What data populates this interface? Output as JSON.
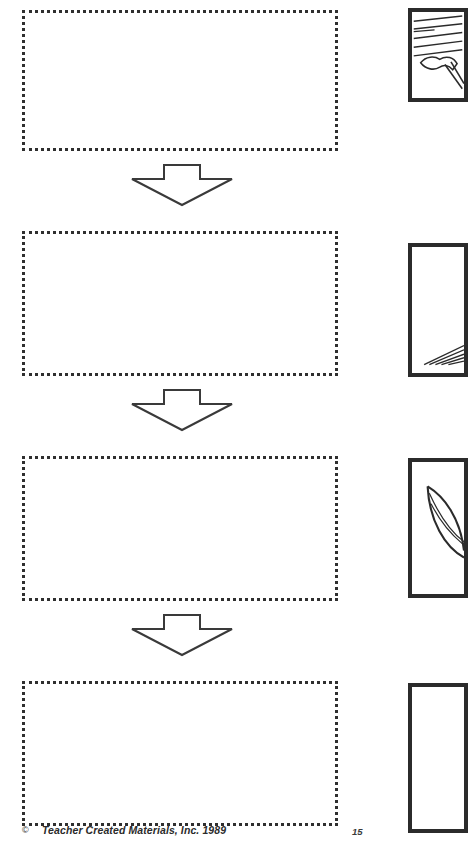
{
  "page": {
    "kind": "worksheet-page",
    "background_color": "#ffffff",
    "ink_color": "#2b2b2b",
    "page_number": "15",
    "footer": {
      "copyright_symbol": "©",
      "copyright_text": "Teacher Created Materials, Inc. 1989"
    }
  },
  "sequence": {
    "description": "Four blank dotted response boxes arranged vertically, joined by three downward block arrows.",
    "boxes": [
      {
        "id": "response-box-1",
        "label": "",
        "placeholder": "",
        "border_style": "dotted",
        "border_color": "#2f2f2f"
      },
      {
        "id": "response-box-2",
        "label": "",
        "placeholder": "",
        "border_style": "dotted",
        "border_color": "#2f2f2f"
      },
      {
        "id": "response-box-3",
        "label": "",
        "placeholder": "",
        "border_style": "dotted",
        "border_color": "#2f2f2f"
      },
      {
        "id": "response-box-4",
        "label": "",
        "placeholder": "",
        "border_style": "dotted",
        "border_color": "#2f2f2f"
      }
    ],
    "arrows": [
      {
        "id": "flow-arrow-1",
        "direction": "down"
      },
      {
        "id": "flow-arrow-2",
        "direction": "down"
      },
      {
        "id": "flow-arrow-3",
        "direction": "down"
      }
    ]
  },
  "illustrations": {
    "description": "Four framed line-art panels along the right margin, cropped by the page edge.",
    "panels": [
      {
        "id": "illustration-panel-1",
        "caption": "",
        "content": "hatched-lines-with-hand-and-tool"
      },
      {
        "id": "illustration-panel-2",
        "caption": "",
        "content": "hatched-lines-at-lower-right"
      },
      {
        "id": "illustration-panel-3",
        "caption": "",
        "content": "curved-leaf-shape"
      },
      {
        "id": "illustration-panel-4",
        "caption": "",
        "content": "blank"
      }
    ]
  }
}
